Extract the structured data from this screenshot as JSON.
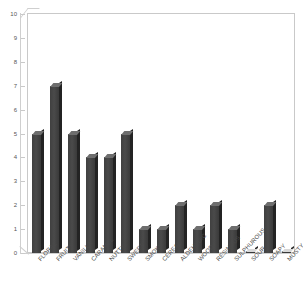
{
  "chart_data": {
    "type": "bar",
    "title": "",
    "xlabel": "",
    "ylabel": "",
    "ylim": [
      0,
      10
    ],
    "ytick_labels": [
      "10",
      "9",
      "8",
      "7",
      "6",
      "5",
      "4",
      "3",
      "2",
      "1",
      "0"
    ],
    "grid": false,
    "legend": null,
    "style": "3d-column",
    "categories": [
      "FLORAL",
      "FRUITY",
      "VANILLA",
      "CARAMEL",
      "NUTTY",
      "SWEET",
      "SMOKY",
      "CEREAL",
      "ALDEHYDIC",
      "WOODY",
      "RESINOUS",
      "SULPHUROUS",
      "SOUR",
      "SOAPY",
      "MUSTY"
    ],
    "values": [
      5,
      7,
      5,
      4,
      4,
      5,
      1,
      1,
      2,
      1,
      2,
      1,
      0,
      2,
      0
    ],
    "colors": {
      "bar_front": "#4a4a4a",
      "bar_side": "#232323",
      "bar_top": "#6e6e6e",
      "frame": "#c9c9c9",
      "background": "#ffffff",
      "text": "#4a4a4a"
    }
  }
}
